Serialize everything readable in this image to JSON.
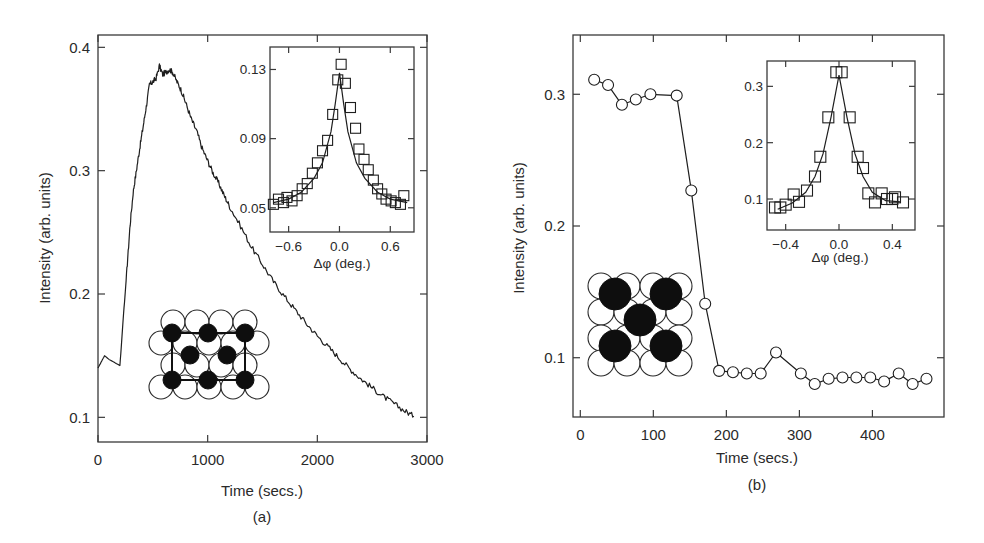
{
  "chart_data": [
    {
      "panel": "(a)",
      "type": "line",
      "xlabel": "Time (secs.)",
      "ylabel": "Intensity (arb. units)",
      "caption": "(a)",
      "xlim": [
        0,
        3000
      ],
      "ylim": [
        0.08,
        0.41
      ],
      "xticks": [
        0,
        1000,
        2000,
        3000
      ],
      "xtick_labels": [
        "0",
        "1000",
        "2000",
        "3000"
      ],
      "yticks": [
        0.1,
        0.2,
        0.3,
        0.4
      ],
      "ytick_labels": [
        "0.1",
        "0.2",
        "0.3",
        "0.4"
      ],
      "grid": false,
      "series": [
        {
          "name": "intensity",
          "style": "line",
          "x": [
            0,
            30,
            60,
            100,
            140,
            180,
            200,
            230,
            260,
            290,
            320,
            350,
            380,
            410,
            440,
            470,
            500,
            530,
            560,
            590,
            620,
            650,
            680,
            720,
            760,
            800,
            850,
            900,
            950,
            1000,
            1050,
            1100,
            1150,
            1200,
            1300,
            1400,
            1500,
            1600,
            1700,
            1800,
            1900,
            2000,
            2100,
            2200,
            2300,
            2400,
            2500,
            2600,
            2700,
            2800,
            2880
          ],
          "y": [
            0.14,
            0.145,
            0.15,
            0.147,
            0.145,
            0.143,
            0.142,
            0.18,
            0.215,
            0.253,
            0.282,
            0.3,
            0.318,
            0.335,
            0.352,
            0.37,
            0.372,
            0.375,
            0.385,
            0.378,
            0.38,
            0.382,
            0.38,
            0.372,
            0.365,
            0.355,
            0.342,
            0.332,
            0.318,
            0.308,
            0.298,
            0.29,
            0.28,
            0.271,
            0.255,
            0.238,
            0.224,
            0.21,
            0.198,
            0.187,
            0.176,
            0.166,
            0.157,
            0.148,
            0.139,
            0.131,
            0.124,
            0.117,
            0.111,
            0.105,
            0.101
          ]
        }
      ],
      "inset": {
        "type": "scatter",
        "xlabel": "Δφ (deg.)",
        "xlim": [
          -0.82,
          0.88
        ],
        "ylim": [
          0.036,
          0.143
        ],
        "xticks": [
          -0.6,
          0.0,
          0.6
        ],
        "xtick_labels": [
          "−0.6",
          "0.0",
          "0.6"
        ],
        "yticks": [
          0.05,
          0.09,
          0.13
        ],
        "ytick_labels": [
          "0.05",
          "0.09",
          "0.13"
        ],
        "series": [
          {
            "name": "data",
            "marker": "square",
            "x": [
              -0.78,
              -0.72,
              -0.66,
              -0.62,
              -0.56,
              -0.5,
              -0.44,
              -0.38,
              -0.32,
              -0.26,
              -0.2,
              -0.14,
              -0.08,
              -0.02,
              0.02,
              0.07,
              0.13,
              0.19,
              0.23,
              0.29,
              0.34,
              0.4,
              0.45,
              0.5,
              0.55,
              0.61,
              0.66,
              0.72,
              0.76
            ],
            "y": [
              0.052,
              0.055,
              0.053,
              0.056,
              0.054,
              0.057,
              0.061,
              0.064,
              0.07,
              0.076,
              0.083,
              0.089,
              0.104,
              0.124,
              0.133,
              0.122,
              0.108,
              0.096,
              0.084,
              0.078,
              0.072,
              0.066,
              0.061,
              0.058,
              0.055,
              0.054,
              0.053,
              0.052,
              0.057
            ]
          },
          {
            "name": "fit",
            "style": "line",
            "x": [
              -0.78,
              -0.6,
              -0.45,
              -0.3,
              -0.2,
              -0.1,
              -0.05,
              0.0,
              0.05,
              0.1,
              0.2,
              0.3,
              0.45,
              0.6,
              0.8
            ],
            "y": [
              0.053,
              0.055,
              0.059,
              0.067,
              0.076,
              0.094,
              0.11,
              0.128,
              0.11,
              0.094,
              0.076,
              0.067,
              0.059,
              0.055,
              0.053
            ]
          }
        ]
      },
      "schematic": "surface lattice: open circles (substrate) with black adsorbate atoms forming a centered rectangular unit cell"
    },
    {
      "panel": "(b)",
      "type": "line",
      "xlabel": "Time (secs.)",
      "ylabel": "Intensity (arb. units)",
      "caption": "(b)",
      "xlim": [
        -10,
        498
      ],
      "ylim": [
        0.055,
        0.345
      ],
      "xticks": [
        0,
        100,
        200,
        300,
        400
      ],
      "xtick_labels": [
        "0",
        "100",
        "200",
        "300",
        "400"
      ],
      "yticks": [
        0.1,
        0.2,
        0.3
      ],
      "ytick_labels": [
        "0.1",
        "0.2",
        "0.3"
      ],
      "grid": false,
      "series": [
        {
          "name": "intensity",
          "marker": "circle",
          "style": "line+markers",
          "x": [
            19,
            38,
            57,
            76,
            96,
            132,
            152,
            171,
            190,
            209,
            228,
            247,
            268,
            302,
            321,
            340,
            359,
            378,
            397,
            416,
            436,
            455,
            474
          ],
          "y": [
            0.311,
            0.307,
            0.292,
            0.296,
            0.3,
            0.299,
            0.227,
            0.141,
            0.09,
            0.089,
            0.088,
            0.088,
            0.104,
            0.088,
            0.08,
            0.084,
            0.085,
            0.085,
            0.085,
            0.082,
            0.088,
            0.08,
            0.084
          ]
        }
      ],
      "inset": {
        "type": "scatter",
        "xlabel": "Δφ (deg.)",
        "xlim": [
          -0.54,
          0.57
        ],
        "ylim": [
          0.045,
          0.345
        ],
        "xticks": [
          -0.4,
          0.0,
          0.4
        ],
        "xtick_labels": [
          "−0.4",
          "0.0",
          "0.4"
        ],
        "yticks": [
          0.1,
          0.2,
          0.3
        ],
        "ytick_labels": [
          "0.1",
          "0.2",
          "0.3"
        ],
        "series": [
          {
            "name": "data",
            "marker": "square",
            "x": [
              -0.48,
              -0.44,
              -0.4,
              -0.34,
              -0.3,
              -0.24,
              -0.18,
              -0.14,
              -0.08,
              -0.02,
              0.02,
              0.08,
              0.14,
              0.18,
              0.22,
              0.27,
              0.32,
              0.36,
              0.4,
              0.42,
              0.48
            ],
            "y": [
              0.085,
              0.085,
              0.09,
              0.108,
              0.095,
              0.115,
              0.14,
              0.175,
              0.245,
              0.325,
              0.325,
              0.245,
              0.175,
              0.155,
              0.11,
              0.094,
              0.11,
              0.1,
              0.1,
              0.103,
              0.094
            ],
            "note": "markers drawn as squares"
          },
          {
            "name": "fit",
            "style": "line",
            "x": [
              -0.46,
              -0.35,
              -0.25,
              -0.18,
              -0.12,
              -0.06,
              0.0,
              0.06,
              0.12,
              0.18,
              0.25,
              0.35,
              0.46
            ],
            "y": [
              0.082,
              0.093,
              0.112,
              0.14,
              0.18,
              0.245,
              0.32,
              0.245,
              0.18,
              0.14,
              0.112,
              0.097,
              0.095
            ]
          }
        ]
      },
      "schematic": "surface lattice: open circles (substrate) with five large black adsorbate atoms in a c(2x2)-like arrangement"
    }
  ],
  "figure": {
    "panel_a": {
      "caption": "(a)",
      "xlabel": "Time (secs.)",
      "ylabel": "Intensity (arb. units)",
      "inset_xlabel": "Δφ (deg.)"
    },
    "panel_b": {
      "caption": "(b)",
      "xlabel": "Time (secs.)",
      "ylabel": "Intensity (arb. units)",
      "inset_xlabel": "Δφ (deg.)"
    }
  }
}
